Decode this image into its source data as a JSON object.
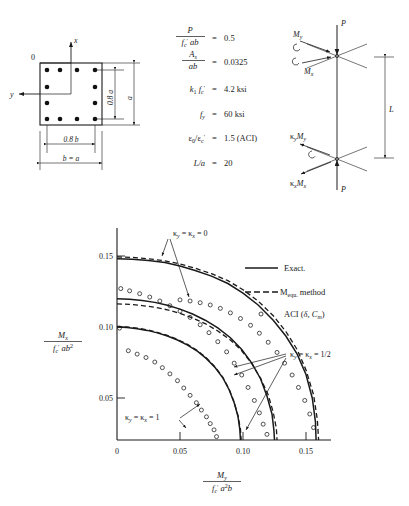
{
  "figure": {
    "cross_section": {
      "origin_label": "0",
      "axis_x_label": "x",
      "axis_y_label": "y",
      "dim_inner_height": "0.8 a",
      "dim_outer_height": "a",
      "dim_inner_width": "0.8 b",
      "dim_outer_width": "b = a",
      "bars_per_side": 4,
      "total_bars": 12
    },
    "parameters": [
      {
        "lhs_num": "P",
        "lhs_den": "f'c ab",
        "eq": "=",
        "value": "0.5"
      },
      {
        "lhs_num": "As",
        "lhs_den": "ab",
        "eq": "=",
        "value": "0.0325"
      },
      {
        "lhs_inline": "k1 f'c",
        "eq": "=",
        "value": "4.2 ksi"
      },
      {
        "lhs_inline": "fy",
        "eq": "=",
        "value": "60 ksi"
      },
      {
        "lhs_inline": "e0/e'c",
        "eq": "=",
        "value": "1.5 (ACI)"
      },
      {
        "lhs_inline": "L/a",
        "eq": "=",
        "value": "20"
      }
    ],
    "column": {
      "top_load": "P",
      "bottom_load": "P",
      "top_moment_y": "My",
      "top_moment_x": "Mx",
      "bottom_moment_y": "κ y My",
      "bottom_moment_x": "κ x Mx",
      "length_label": "L"
    }
  },
  "chart_data": {
    "type": "line",
    "title": "",
    "xlabel_num": "My",
    "xlabel_den": "f'c a²b",
    "ylabel_num": "Mx",
    "ylabel_den": "f'c ab²",
    "xlim": [
      0,
      0.17
    ],
    "ylim": [
      0,
      0.175
    ],
    "xticks": [
      0,
      0.05,
      0.1,
      0.15
    ],
    "xticklabels": [
      "0",
      "0.05",
      "0.10",
      "0.15"
    ],
    "yticks": [
      0.05,
      0.1,
      0.15
    ],
    "yticklabels": [
      "0.05",
      "0.10",
      "0.15"
    ],
    "grid": false,
    "legend_position": "upper-right-inside",
    "legend": [
      {
        "key": "exact",
        "label": "Exact.",
        "style": "solid-line"
      },
      {
        "key": "mequ",
        "label": "M equ. method",
        "style": "dashed-line",
        "sub": "equ."
      },
      {
        "key": "aci",
        "label": "ACI (δ, Cm)",
        "style": "open-circle"
      }
    ],
    "annotations": [
      {
        "key": "k0",
        "text": "κ y = κ x = 0",
        "at": [
          0.045,
          0.172
        ]
      },
      {
        "key": "khalf",
        "text": "κ y = κ x = 1/2",
        "at": [
          0.152,
          0.074
        ]
      },
      {
        "key": "k1",
        "text": "κ y = κ x = 1",
        "at": [
          0.022,
          0.021
        ]
      }
    ],
    "series": [
      {
        "name": "Exact, kappa=0",
        "curve": "exact",
        "kappa": 0,
        "x": [
          0.0,
          0.012,
          0.025,
          0.038,
          0.05,
          0.062,
          0.075,
          0.088,
          0.1,
          0.112,
          0.124,
          0.134,
          0.143,
          0.15,
          0.155,
          0.1575,
          0.158
        ],
        "y": [
          0.1605,
          0.16,
          0.1588,
          0.157,
          0.154,
          0.15,
          0.145,
          0.1385,
          0.13,
          0.1195,
          0.106,
          0.092,
          0.076,
          0.058,
          0.037,
          0.016,
          0.0
        ]
      },
      {
        "name": "Mequ, kappa=0",
        "curve": "mequ",
        "kappa": 0,
        "x": [
          0.0,
          0.012,
          0.025,
          0.038,
          0.05,
          0.062,
          0.075,
          0.088,
          0.1,
          0.112,
          0.124,
          0.134,
          0.143,
          0.15,
          0.156,
          0.159,
          0.16
        ],
        "y": [
          0.162,
          0.1616,
          0.1604,
          0.1586,
          0.1558,
          0.152,
          0.1472,
          0.141,
          0.133,
          0.123,
          0.11,
          0.096,
          0.08,
          0.062,
          0.04,
          0.018,
          0.0
        ]
      },
      {
        "name": "ACI, kappa=0",
        "curve": "aci",
        "kappa": 0,
        "x": [
          0.05,
          0.058,
          0.066,
          0.074,
          0.082,
          0.09,
          0.098,
          0.106,
          0.113,
          0.12,
          0.127,
          0.133,
          0.139,
          0.144,
          0.149,
          0.153,
          0.156
        ],
        "y": [
          0.124,
          0.123,
          0.1215,
          0.1195,
          0.1165,
          0.1125,
          0.1075,
          0.1015,
          0.0945,
          0.0865,
          0.0775,
          0.068,
          0.0575,
          0.0465,
          0.035,
          0.023,
          0.011
        ]
      },
      {
        "name": "Exact, kappa=1/2",
        "curve": "exact",
        "kappa": 0.5,
        "x": [
          0.0,
          0.01,
          0.02,
          0.03,
          0.04,
          0.05,
          0.06,
          0.07,
          0.08,
          0.09,
          0.099,
          0.107,
          0.114,
          0.119,
          0.123,
          0.1245,
          0.125
        ],
        "y": [
          0.125,
          0.1245,
          0.1235,
          0.1218,
          0.1192,
          0.1158,
          0.1115,
          0.106,
          0.0992,
          0.0905,
          0.08,
          0.068,
          0.054,
          0.039,
          0.023,
          0.009,
          0.0
        ]
      },
      {
        "name": "Mequ, kappa=1/2",
        "curve": "mequ",
        "kappa": 0.5,
        "x": [
          0.0,
          0.01,
          0.02,
          0.03,
          0.04,
          0.05,
          0.06,
          0.07,
          0.08,
          0.09,
          0.099,
          0.107,
          0.114,
          0.12,
          0.124,
          0.1265,
          0.127
        ],
        "y": [
          0.1205,
          0.12,
          0.119,
          0.1175,
          0.1152,
          0.112,
          0.108,
          0.103,
          0.0965,
          0.0885,
          0.079,
          0.0675,
          0.0545,
          0.04,
          0.0245,
          0.01,
          0.0
        ]
      },
      {
        "name": "ACI, kappa=1/2",
        "curve": "aci",
        "kappa": 0.5,
        "x": [
          0.003,
          0.01,
          0.018,
          0.026,
          0.034,
          0.042,
          0.05,
          0.058,
          0.066,
          0.073,
          0.08,
          0.087,
          0.093,
          0.099,
          0.104,
          0.109,
          0.113,
          0.116,
          0.119
        ],
        "y": [
          0.134,
          0.132,
          0.1295,
          0.1265,
          0.123,
          0.1188,
          0.114,
          0.1085,
          0.102,
          0.095,
          0.087,
          0.078,
          0.068,
          0.0575,
          0.0465,
          0.035,
          0.024,
          0.014,
          0.005
        ]
      },
      {
        "name": "Exact, kappa=1",
        "curve": "exact",
        "kappa": 1,
        "x": [
          0.0,
          0.008,
          0.016,
          0.024,
          0.032,
          0.04,
          0.048,
          0.056,
          0.064,
          0.071,
          0.078,
          0.084,
          0.089,
          0.093,
          0.096,
          0.0975,
          0.098
        ],
        "y": [
          0.1,
          0.0995,
          0.0985,
          0.097,
          0.0948,
          0.092,
          0.0885,
          0.084,
          0.0785,
          0.072,
          0.064,
          0.055,
          0.0445,
          0.033,
          0.021,
          0.009,
          0.0
        ]
      },
      {
        "name": "Mequ, kappa=1",
        "curve": "mequ",
        "kappa": 1,
        "x": [
          0.0,
          0.008,
          0.016,
          0.024,
          0.032,
          0.04,
          0.048,
          0.056,
          0.064,
          0.071,
          0.078,
          0.084,
          0.089,
          0.093,
          0.096,
          0.098,
          0.0985
        ],
        "y": [
          0.1005,
          0.1,
          0.099,
          0.0975,
          0.0953,
          0.0925,
          0.089,
          0.0846,
          0.079,
          0.0725,
          0.0645,
          0.0555,
          0.045,
          0.0335,
          0.0215,
          0.0095,
          0.0
        ]
      },
      {
        "name": "ACI, kappa=1",
        "curve": "aci",
        "kappa": 1,
        "x": [
          0.002,
          0.009,
          0.016,
          0.023,
          0.03,
          0.036,
          0.042,
          0.048,
          0.053,
          0.058,
          0.063,
          0.067,
          0.071,
          0.074,
          0.077,
          0.079
        ],
        "y": [
          0.099,
          0.079,
          0.076,
          0.073,
          0.069,
          0.064,
          0.0585,
          0.0525,
          0.046,
          0.0395,
          0.033,
          0.0265,
          0.0205,
          0.0145,
          0.009,
          0.003
        ]
      }
    ]
  }
}
